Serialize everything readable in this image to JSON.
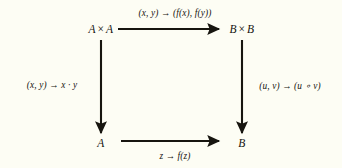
{
  "diagram": {
    "type": "commutative-square",
    "background_color": "#fdfdf4",
    "ink_color": "#17150f",
    "nodes": {
      "top_left": {
        "label": "A × A",
        "base": "A",
        "operator": "×",
        "x": 101,
        "y": 29
      },
      "top_right": {
        "label": "B × B",
        "base": "B",
        "operator": "×",
        "x": 242,
        "y": 29
      },
      "bottom_left": {
        "label": "A",
        "x": 101,
        "y": 143
      },
      "bottom_right": {
        "label": "B",
        "x": 242,
        "y": 143
      }
    },
    "edges": {
      "top": {
        "label": "(x, y) → (f(x), f(y))",
        "from": "top_left",
        "to": "top_right",
        "direction": "right",
        "label_x": 175,
        "label_y": 13,
        "x1": 118,
        "y1": 29,
        "x2": 219,
        "y2": 29
      },
      "left": {
        "label": "(x, y) → x · y",
        "from": "top_left",
        "to": "bottom_left",
        "direction": "down",
        "label_x": 52,
        "label_y": 85,
        "x1": 101,
        "y1": 40,
        "x2": 101,
        "y2": 133
      },
      "right": {
        "label": "(u, v) → (u ∘ v)",
        "from": "top_right",
        "to": "bottom_right",
        "direction": "down",
        "label_x": 290,
        "label_y": 85,
        "x1": 242,
        "y1": 40,
        "x2": 242,
        "y2": 133
      },
      "bottom": {
        "label": "z → f(z)",
        "from": "bottom_left",
        "to": "bottom_right",
        "direction": "right",
        "label_x": 175,
        "label_y": 156,
        "x1": 121,
        "y1": 141,
        "x2": 219,
        "y2": 141
      }
    }
  }
}
